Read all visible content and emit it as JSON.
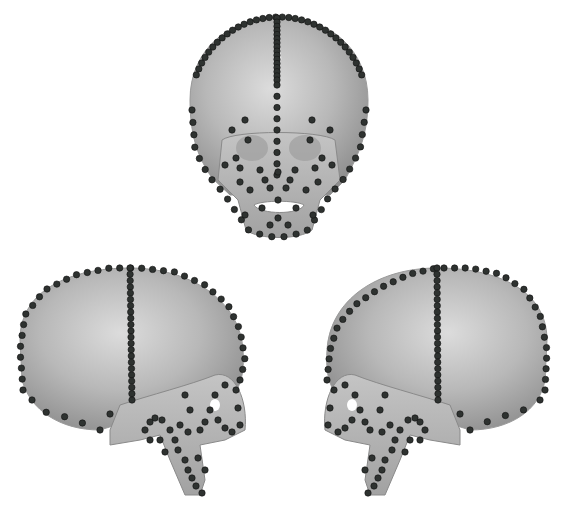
{
  "figure": {
    "views": [
      {
        "id": "frontal",
        "label": "frontal-view"
      },
      {
        "id": "left-lateral",
        "label": "left-lateral-view"
      },
      {
        "id": "right-lateral",
        "label": "right-lateral-view"
      }
    ],
    "colors": {
      "bone": "#b4b4b4",
      "bone_light": "#d8d8d8",
      "bone_dark": "#8c8c8c",
      "landmark": "#2e3230",
      "landmark_edge": "#111111",
      "background": "#ffffff"
    },
    "landmark_radius": 3.2
  }
}
